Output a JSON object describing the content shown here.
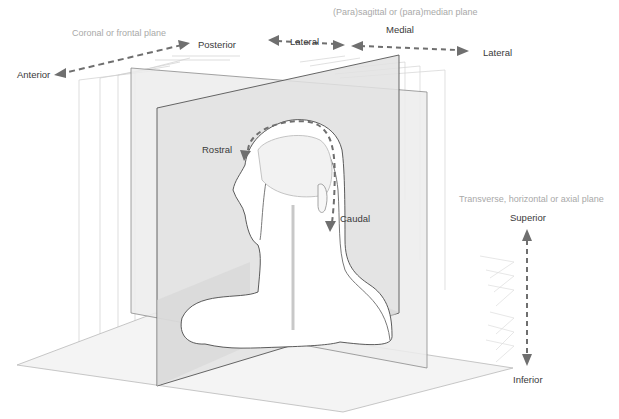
{
  "diagram": {
    "colors": {
      "arrow": "#6f6f6f",
      "plane_fill": "#e6e6e6",
      "plane_edge": "#555555",
      "ghost_edge": "#c8c8c8",
      "figure_fill": "#ffffff",
      "plane_label": "#a9a9a9",
      "direction_label": "#3a3a3a"
    },
    "planes": {
      "coronal": "Coronal or frontal plane",
      "sagittal": "(Para)sagittal or (para)median plane",
      "transverse": "Transverse, horizontal or axial plane"
    },
    "directions": {
      "anterior": "Anterior",
      "posterior": "Posterior",
      "lateral_left": "Lateral",
      "medial": "Medial",
      "lateral_right": "Lateral",
      "rostral": "Rostral",
      "caudal": "Caudal",
      "superior": "Superior",
      "inferior": "Inferior"
    }
  }
}
